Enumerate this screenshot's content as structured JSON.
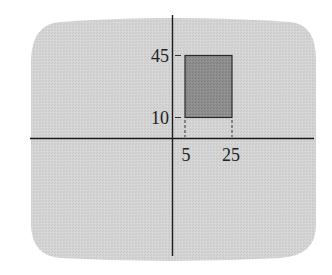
{
  "diagram": {
    "type": "coordinate-plane-rectangle",
    "colors": {
      "screen_background": "#d2d2d2",
      "rectangle_fill": "#8c8c8c",
      "rectangle_stroke": "#2a2a2a",
      "axis": "#1a1a1a",
      "label": "#222222"
    },
    "y_ticks": [
      {
        "value": 45,
        "label": "45"
      },
      {
        "value": 10,
        "label": "10"
      }
    ],
    "x_ticks": [
      {
        "value": 5,
        "label": "5"
      },
      {
        "value": 25,
        "label": "25"
      }
    ],
    "rectangle": {
      "x_min": 5,
      "x_max": 25,
      "y_min": 10,
      "y_max": 45
    }
  }
}
